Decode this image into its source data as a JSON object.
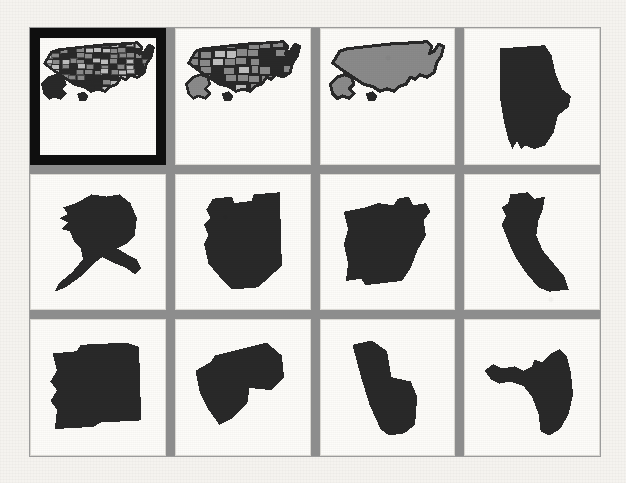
{
  "page": {
    "panel_background_color": "#8d8d8d",
    "tile_background_color": "#fbfaf7",
    "shape_fill_color": "#2b2b2b",
    "state_fill_color": "#8a8a8a",
    "selection_border_color": "#111111",
    "scan_page_color": "#f3f1ed"
  },
  "grid": {
    "columns": 4,
    "rows": 3,
    "total_tiles": 12,
    "selected_index": 0
  },
  "tiles": [
    {
      "index": 0,
      "label": "United States - Counties",
      "icon": "usa-counties-map-icon",
      "kind": "usa-detailed",
      "selected": true
    },
    {
      "index": 1,
      "label": "United States - States",
      "icon": "usa-states-map-icon",
      "kind": "usa-states",
      "selected": false
    },
    {
      "index": 2,
      "label": "United States - Outline",
      "icon": "usa-outline-map-icon",
      "kind": "usa-outline",
      "selected": false
    },
    {
      "index": 3,
      "label": "Alabama",
      "icon": "alabama-map-icon",
      "kind": "state",
      "selected": false
    },
    {
      "index": 4,
      "label": "Alaska",
      "icon": "alaska-map-icon",
      "kind": "state",
      "selected": false
    },
    {
      "index": 5,
      "label": "Arizona",
      "icon": "arizona-map-icon",
      "kind": "state",
      "selected": false
    },
    {
      "index": 6,
      "label": "Arkansas",
      "icon": "arkansas-map-icon",
      "kind": "state",
      "selected": false
    },
    {
      "index": 7,
      "label": "California",
      "icon": "california-map-icon",
      "kind": "state",
      "selected": false
    },
    {
      "index": 8,
      "label": "Colorado",
      "icon": "colorado-map-icon",
      "kind": "state",
      "selected": false
    },
    {
      "index": 9,
      "label": "Connecticut",
      "icon": "connecticut-map-icon",
      "kind": "state",
      "selected": false
    },
    {
      "index": 10,
      "label": "Delaware",
      "icon": "delaware-map-icon",
      "kind": "state",
      "selected": false
    },
    {
      "index": 11,
      "label": "Florida",
      "icon": "florida-map-icon",
      "kind": "state",
      "selected": false
    }
  ]
}
